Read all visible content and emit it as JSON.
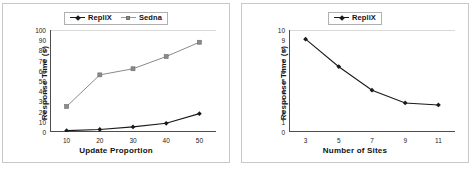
{
  "figure": {
    "background": "#ffffff",
    "panel_border_color": "#c9c9c9"
  },
  "colors": {
    "replix": "#1a1a1a",
    "sedna": "#8a8a8a",
    "axis": "#4d4d4d",
    "grid": "#d9d9d9",
    "text": "#111111"
  },
  "chart_data": [
    {
      "id": "left",
      "type": "line",
      "title": "",
      "xlabel": "Update Proportion",
      "ylabel": "Response Time (s)",
      "x": [
        10,
        20,
        30,
        40,
        50
      ],
      "xticklabels": [
        "10",
        "20",
        "30",
        "40",
        "50"
      ],
      "yticklabels": [
        "0",
        "10",
        "20",
        "30",
        "40",
        "50",
        "60",
        "70",
        "80",
        "90",
        "100"
      ],
      "xlim": [
        5,
        55
      ],
      "ylim": [
        0,
        100
      ],
      "ytick_step": 10,
      "grid": "horizontal-top-only",
      "legend_position": "top-center",
      "series": [
        {
          "name": "RepliX",
          "color": "#1a1a1a",
          "marker": "diamond",
          "values": [
            1.3,
            2.5,
            5.0,
            8.5,
            18.0
          ]
        },
        {
          "name": "Sedna",
          "color": "#8a8a8a",
          "marker": "square",
          "values": [
            25.0,
            56.0,
            62.0,
            74.0,
            88.0
          ]
        }
      ]
    },
    {
      "id": "right",
      "type": "line",
      "title": "",
      "xlabel": "Number of Sites",
      "ylabel": "Response Time (s)",
      "x": [
        3,
        5,
        7,
        9,
        11
      ],
      "xticklabels": [
        "3",
        "5",
        "7",
        "9",
        "11"
      ],
      "yticklabels": [
        "0",
        "1",
        "2",
        "3",
        "4",
        "5",
        "6",
        "7",
        "8",
        "9",
        "10"
      ],
      "xlim": [
        2,
        12
      ],
      "ylim": [
        0,
        10
      ],
      "ytick_step": 1,
      "grid": "horizontal-top-only",
      "legend_position": "top-center",
      "series": [
        {
          "name": "RepliX",
          "color": "#1a1a1a",
          "marker": "diamond",
          "values": [
            9.1,
            6.4,
            4.1,
            2.85,
            2.65
          ]
        }
      ]
    }
  ],
  "left_panel": {
    "legend": [
      {
        "label": "RepliX",
        "marker": "diamond",
        "color": "#1a1a1a"
      },
      {
        "label": "Sedna",
        "marker": "square",
        "color": "#8a8a8a"
      }
    ],
    "xlabel": "Update Proportion",
    "ylabel": "Response Time (s)"
  },
  "right_panel": {
    "legend": [
      {
        "label": "RepliX",
        "marker": "diamond",
        "color": "#1a1a1a"
      }
    ],
    "xlabel": "Number of Sites",
    "ylabel": "Response Time (s)"
  }
}
